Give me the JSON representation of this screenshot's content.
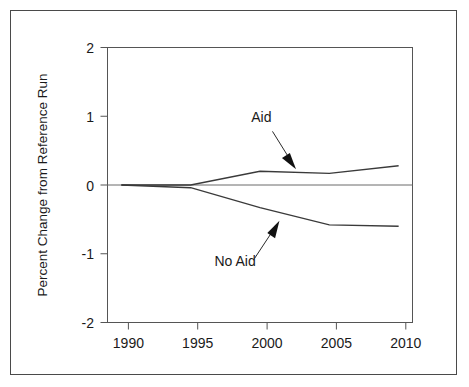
{
  "chart_data": {
    "type": "line",
    "title": "",
    "xlabel": "",
    "ylabel": "Percent Change from Reference Run",
    "x": [
      1990,
      1995,
      2000,
      2005,
      2010
    ],
    "xlim": [
      1989,
      2011
    ],
    "ylim": [
      -2,
      2
    ],
    "xticks": [
      1990,
      1995,
      2000,
      2005,
      2010
    ],
    "xticklabels": [
      "1990",
      "1995",
      "2000",
      "2005",
      "2010"
    ],
    "yticks": [
      2,
      1,
      0,
      -1,
      -2
    ],
    "yticklabels": [
      "2",
      "1",
      "0",
      "-1",
      "-2"
    ],
    "grid": false,
    "legend_position": "inline-annotations",
    "zero_line": true,
    "series": [
      {
        "name": "Aid",
        "values": [
          0.0,
          0.0,
          0.2,
          0.17,
          0.28
        ],
        "color": "#3a3a3a"
      },
      {
        "name": "No Aid",
        "values": [
          0.0,
          -0.04,
          -0.33,
          -0.58,
          -0.6
        ],
        "color": "#3a3a3a"
      }
    ],
    "annotations": [
      {
        "text": "Aid",
        "label_x": 2000.1,
        "label_y": 0.92,
        "arrow_from_x": 2000.9,
        "arrow_from_y": 0.78,
        "arrow_to_x": 2002.6,
        "arrow_to_y": 0.23
      },
      {
        "text": "No Aid",
        "label_x": 1998.2,
        "label_y": -1.18,
        "arrow_from_x": 1999.6,
        "arrow_from_y": -1.07,
        "arrow_to_x": 2001.4,
        "arrow_to_y": -0.52
      }
    ]
  },
  "axis": {
    "y_title": "Percent Change from Reference Run",
    "y_tick_2": "2",
    "y_tick_1": "1",
    "y_tick_0": "0",
    "y_tick_m1": "-1",
    "y_tick_m2": "-2",
    "x_tick_1990": "1990",
    "x_tick_1995": "1995",
    "x_tick_2000": "2000",
    "x_tick_2005": "2005",
    "x_tick_2010": "2010"
  },
  "labels": {
    "aid": "Aid",
    "no_aid": "No Aid"
  },
  "colors": {
    "frame": "#4a4a4a",
    "plot_box": "#555555",
    "line": "#3a3a3a",
    "text": "#1a1a1a",
    "background": "#ffffff"
  }
}
